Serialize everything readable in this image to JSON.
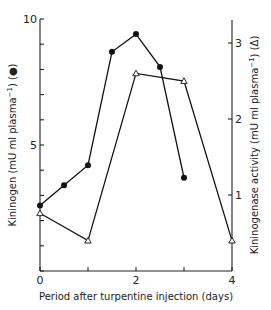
{
  "chart_data": {
    "type": "line",
    "title": "",
    "xlabel": "Period after turpentine injection (days)",
    "ylabel": "Kininogen (mU ml plasma⁻¹) (●)",
    "y2label": "Kininogenase activity (mU ml plasma⁻¹) (Δ)",
    "xlim": [
      0,
      4
    ],
    "ylim": [
      0,
      10
    ],
    "y2lim": [
      0,
      3.3
    ],
    "xticks": [
      0,
      1,
      2,
      3,
      4
    ],
    "xtick_labels": [
      "0",
      "",
      "2",
      "",
      "4"
    ],
    "yticks": [
      0,
      1,
      2,
      3,
      4,
      5,
      6,
      7,
      8,
      9,
      10
    ],
    "ytick_labels": [
      "",
      "",
      "",
      "",
      "",
      "5",
      "",
      "",
      "",
      "",
      "10"
    ],
    "y2ticks": [
      1,
      2,
      3
    ],
    "y2tick_labels": [
      "1",
      "2",
      "3"
    ],
    "grid": false,
    "legend": "none (markers identified in axis labels)",
    "series": [
      {
        "name": "Kininogen",
        "axis": "left",
        "marker": "filled-circle",
        "x": [
          0,
          0.5,
          1,
          1.5,
          2,
          2.5,
          3
        ],
        "values": [
          2.6,
          3.4,
          4.2,
          8.7,
          9.4,
          8.1,
          3.7
        ]
      },
      {
        "name": "Kininogenase activity",
        "axis": "right",
        "marker": "open-triangle",
        "x": [
          0,
          1,
          2,
          3,
          4
        ],
        "values": [
          0.76,
          0.4,
          2.6,
          2.5,
          0.4
        ]
      }
    ]
  },
  "labels": {
    "xlabel": "Period after turpentine injection (days)",
    "ylabel_main": "Kininogen (mU ml plasma",
    "ylabel_sup": "−1",
    "ylabel_tail": ") (●)",
    "y2label_main": "Kininogenase activity (mU ml plasma",
    "y2label_sup": "−1",
    "y2label_tail": ") (Δ)"
  }
}
